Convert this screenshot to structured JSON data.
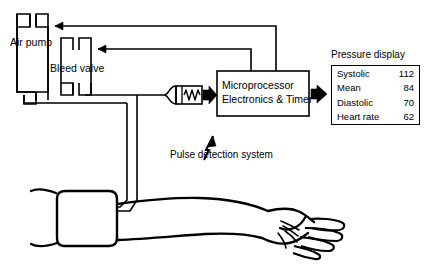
{
  "diagram": {
    "components": {
      "air_pump_label": "Air pump",
      "bleed_valve_label": "Bleed valve",
      "transducer_label": "pressure-transducer",
      "microprocessor_line1": "Microprocessor",
      "microprocessor_line2": "Electronics & Timer",
      "pulse_detection_label": "Pulse detection system",
      "pressure_display_label": "Pressure display",
      "cuff_label": "cuff",
      "arm_label": "arm",
      "hand_label": "hand"
    },
    "display": {
      "rows": [
        {
          "name": "Systolic",
          "value": "112"
        },
        {
          "name": "Mean",
          "value": "84"
        },
        {
          "name": "Diastolic",
          "value": "70"
        },
        {
          "name": "Heart rate",
          "value": "62"
        }
      ]
    },
    "colors": {
      "stroke": "#000000",
      "background": "#ffffff"
    }
  }
}
